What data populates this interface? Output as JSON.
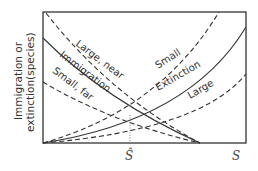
{
  "diagram": {
    "type": "island-biogeography-equilibrium",
    "y_axis_label_line1": "Immigration or",
    "y_axis_label_line2": "extinction(species)",
    "x_axis_end_label": "S",
    "equilibrium_label": "Ŝ",
    "curves": {
      "immigration_large_near": "Large, near",
      "immigration_mid": "Immigration",
      "immigration_small_far": "Small, far",
      "extinction_small": "Small",
      "extinction_mid": "Extinction",
      "extinction_large": "Large"
    },
    "colors": {
      "line": "#333333",
      "background": "#ffffff"
    }
  }
}
